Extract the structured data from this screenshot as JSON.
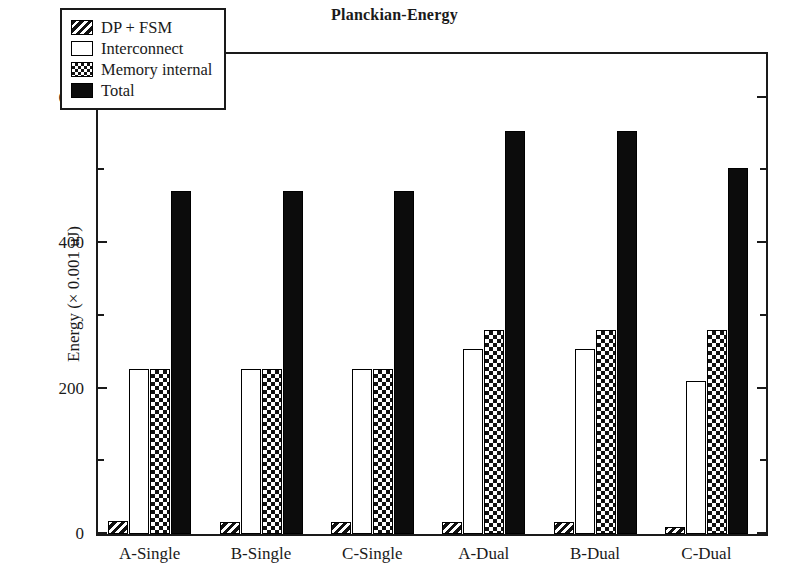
{
  "chart_data": {
    "type": "bar",
    "title": "Planckian-Energy",
    "xlabel": "",
    "ylabel": "Energy (× 0.001 uJ)",
    "ylim": [
      0,
      660
    ],
    "yticks": [
      0,
      200,
      400,
      600
    ],
    "yticks_minor": [
      100,
      300,
      500
    ],
    "grid": false,
    "legend_position": "upper-left-inside",
    "categories": [
      "A-Single",
      "B-Single",
      "C-Single",
      "A-Dual",
      "B-Dual",
      "C-Dual"
    ],
    "series": [
      {
        "name": "DP + FSM",
        "pattern": "diagonal-hatch",
        "values": [
          18,
          17,
          17,
          17,
          16,
          10
        ]
      },
      {
        "name": "Interconnect",
        "pattern": "empty",
        "values": [
          227,
          227,
          227,
          254,
          254,
          210
        ]
      },
      {
        "name": "Memory internal",
        "pattern": "checkerboard",
        "values": [
          227,
          227,
          227,
          281,
          281,
          281
        ]
      },
      {
        "name": "Total",
        "pattern": "solid-black",
        "values": [
          472,
          472,
          472,
          554,
          554,
          503
        ]
      }
    ]
  },
  "chart": {
    "title": "Planckian-Energy",
    "y_axis_title": "Energy (× 0.001 uJ)",
    "y_tick_labels": [
      "0",
      "200",
      "400",
      "600"
    ],
    "x_tick_labels": [
      "A-Single",
      "B-Single",
      "C-Single",
      "A-Dual",
      "B-Dual",
      "C-Dual"
    ],
    "legend": [
      {
        "label": "DP + FSM",
        "swatch": "diagonal-hatch-swatch"
      },
      {
        "label": "Interconnect",
        "swatch": "empty-swatch"
      },
      {
        "label": "Memory internal",
        "swatch": "checkerboard-swatch"
      },
      {
        "label": "Total",
        "swatch": "solid-black-swatch"
      }
    ],
    "colors": {
      "axis": "#1a1a1a",
      "bar_fill_total": "#0c0c0c",
      "bar_fill_interconnect": "#ffffff",
      "pattern_ink": "#111111",
      "background": "#ffffff"
    }
  }
}
